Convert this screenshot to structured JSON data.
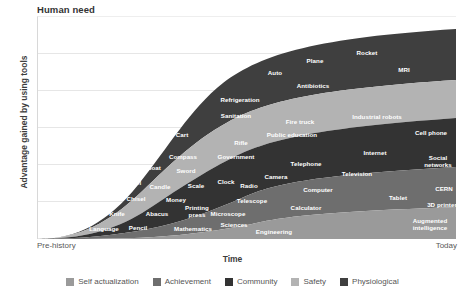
{
  "chart_title": "Human need",
  "axes": {
    "y_title": "Advantage gained by using tools",
    "x_title": "Time",
    "x_start_label": "Pre-history",
    "x_end_label": "Today"
  },
  "chart_data": {
    "type": "area",
    "title": "Human need",
    "xlabel": "Time",
    "ylabel": "Advantage gained by using tools",
    "x": [
      "Pre-history",
      "Today"
    ],
    "xlim": [
      0,
      100
    ],
    "ylim": [
      0,
      100
    ],
    "grid": true,
    "legend_position": "bottom",
    "stacking": "stacked-area",
    "series": [
      {
        "name": "Physiological",
        "color": "#3f3f3f",
        "order": 1,
        "values": [
          0,
          30
        ],
        "annotations": [
          "Fire",
          "Axe",
          "Wheel",
          "Boat",
          "Cart",
          "Sanitation",
          "Refrigeration",
          "Auto",
          "Plane",
          "Rocket",
          "Antibiotics",
          "MRI"
        ]
      },
      {
        "name": "Safety",
        "color": "#b3b3b3",
        "order": 2,
        "values": [
          0,
          18
        ],
        "annotations": [
          "Fish-hook",
          "Saw",
          "Chisel",
          "Sword",
          "Compass",
          "Rifle",
          "Government",
          "Fire truck",
          "Public education",
          "Industrial robots"
        ]
      },
      {
        "name": "Community",
        "color": "#333333",
        "order": 3,
        "values": [
          0,
          22
        ],
        "annotations": [
          "Language",
          "Knife",
          "Candle",
          "Money",
          "Scale",
          "Clock",
          "Radio",
          "Camera",
          "Telephone",
          "Television",
          "Internet",
          "Cell phone",
          "Social networks"
        ]
      },
      {
        "name": "Achievement",
        "color": "#6e6e6e",
        "order": 4,
        "values": [
          0,
          17
        ],
        "annotations": [
          "Pencil",
          "Abacus",
          "Printing press",
          "Microscope",
          "Telescope",
          "Calculator",
          "Computer",
          "Tablet",
          "CERN",
          "3D printer"
        ]
      },
      {
        "name": "Self actualization",
        "color": "#9a9a9a",
        "order": 5,
        "values": [
          0,
          13
        ],
        "annotations": [
          "Mathematics",
          "Sciences",
          "Engineering",
          "Augmented intelligence",
          "?"
        ]
      }
    ]
  },
  "legend": [
    {
      "label": "Self actualization",
      "color": "#9a9a9a"
    },
    {
      "label": "Achievement",
      "color": "#6e6e6e"
    },
    {
      "label": "Community",
      "color": "#333333"
    },
    {
      "label": "Safety",
      "color": "#b3b3b3"
    },
    {
      "label": "Physiological",
      "color": "#3f3f3f"
    }
  ],
  "points": [
    {
      "t": "Fire",
      "x": 14,
      "y": 212
    },
    {
      "t": "Axe",
      "x": 30,
      "y": 226
    },
    {
      "t": "Language",
      "x": 66,
      "y": 228
    },
    {
      "t": "Fish-hook",
      "x": 50,
      "y": 209
    },
    {
      "t": "Knife",
      "x": 79,
      "y": 213
    },
    {
      "t": "Saw",
      "x": 72,
      "y": 198
    },
    {
      "t": "Chisel",
      "x": 98,
      "y": 198
    },
    {
      "t": "Pencil",
      "x": 100,
      "y": 227
    },
    {
      "t": "Abacus",
      "x": 119,
      "y": 213
    },
    {
      "t": "Wheel",
      "x": 94,
      "y": 182
    },
    {
      "t": "Candle",
      "x": 122,
      "y": 186
    },
    {
      "t": "Money",
      "x": 138,
      "y": 199
    },
    {
      "t": "Mathematics",
      "x": 155,
      "y": 228
    },
    {
      "t": "Printing\npress",
      "x": 159,
      "y": 210
    },
    {
      "t": "Scale",
      "x": 158,
      "y": 185
    },
    {
      "t": "Boat",
      "x": 116,
      "y": 167
    },
    {
      "t": "Sword",
      "x": 148,
      "y": 170
    },
    {
      "t": "Compass",
      "x": 145,
      "y": 156
    },
    {
      "t": "Cart",
      "x": 144,
      "y": 134
    },
    {
      "t": "Clock",
      "x": 188,
      "y": 181
    },
    {
      "t": "Microscope",
      "x": 190,
      "y": 213
    },
    {
      "t": "Sciences",
      "x": 196,
      "y": 224
    },
    {
      "t": "Engineering",
      "x": 236,
      "y": 231
    },
    {
      "t": "Telescope",
      "x": 214,
      "y": 200
    },
    {
      "t": "Radio",
      "x": 211,
      "y": 185
    },
    {
      "t": "Camera",
      "x": 238,
      "y": 176
    },
    {
      "t": "Government",
      "x": 198,
      "y": 156
    },
    {
      "t": "Rifle",
      "x": 203,
      "y": 142
    },
    {
      "t": "Sanitation",
      "x": 198,
      "y": 115
    },
    {
      "t": "Refrigeration",
      "x": 202,
      "y": 99
    },
    {
      "t": "Calculator",
      "x": 268,
      "y": 207
    },
    {
      "t": "Computer",
      "x": 280,
      "y": 189
    },
    {
      "t": "Telephone",
      "x": 268,
      "y": 163
    },
    {
      "t": "Public education",
      "x": 254,
      "y": 134
    },
    {
      "t": "Fire truck",
      "x": 262,
      "y": 121
    },
    {
      "t": "Auto",
      "x": 237,
      "y": 72
    },
    {
      "t": "Antibiotics",
      "x": 275,
      "y": 85
    },
    {
      "t": "Plane",
      "x": 277,
      "y": 60
    },
    {
      "t": "Rocket",
      "x": 329,
      "y": 52
    },
    {
      "t": "Television",
      "x": 319,
      "y": 173
    },
    {
      "t": "Internet",
      "x": 337,
      "y": 152
    },
    {
      "t": "Industrial robots",
      "x": 339,
      "y": 116
    },
    {
      "t": "MRI",
      "x": 366,
      "y": 69
    },
    {
      "t": "Tablet",
      "x": 360,
      "y": 197
    },
    {
      "t": "Cell phone",
      "x": 393,
      "y": 132
    },
    {
      "t": "Social\nnetworks",
      "x": 400,
      "y": 160
    },
    {
      "t": "CERN",
      "x": 406,
      "y": 188
    },
    {
      "t": "3D printer",
      "x": 404,
      "y": 204
    },
    {
      "t": "Augmented\nintelligence",
      "x": 392,
      "y": 223
    },
    {
      "t": "?",
      "x": 430,
      "y": 224
    }
  ]
}
